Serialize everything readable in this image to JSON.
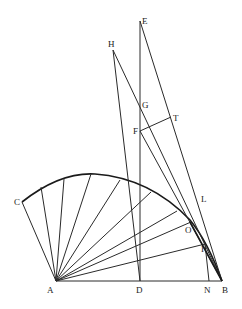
{
  "diagram": {
    "type": "geometric-construction",
    "labels": {
      "A": "A",
      "B": "B",
      "C": "C",
      "D": "D",
      "E": "E",
      "F": "F",
      "G": "G",
      "H": "H",
      "T": "T",
      "L": "L",
      "O": "O",
      "I": "I",
      "N": "N"
    },
    "points": {
      "A": [
        56,
        281
      ],
      "B": [
        222,
        281
      ],
      "C": [
        22,
        202
      ],
      "D": [
        140,
        281
      ],
      "E": [
        140,
        21
      ],
      "F": [
        140,
        131
      ],
      "G": [
        140,
        106
      ],
      "H": [
        113,
        50
      ],
      "T": [
        171,
        117
      ],
      "O": [
        193,
        228
      ],
      "I": [
        205,
        244
      ],
      "N": [
        209,
        281
      ]
    },
    "colors": {
      "stroke": "#2a2a2a",
      "background": "#ffffff"
    }
  }
}
